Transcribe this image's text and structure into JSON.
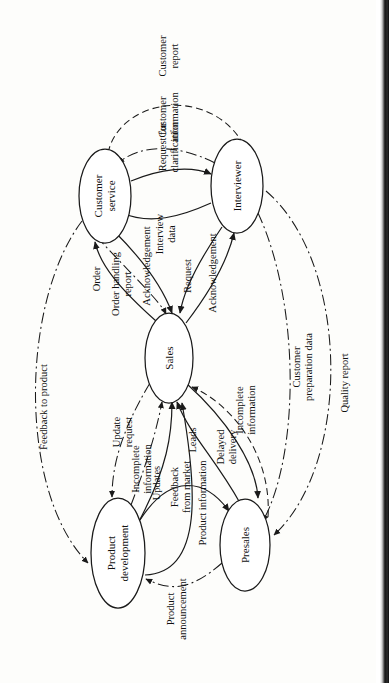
{
  "diagram": {
    "type": "data-flow-diagram",
    "orientation": "rotated-90-ccw",
    "title": "",
    "nodes": [
      {
        "id": "product_development",
        "label": "Product\ndevelopment",
        "line1": "Product",
        "line2": "development",
        "cx": 130,
        "cy": 118,
        "rx": 55,
        "ry": 27
      },
      {
        "id": "presales",
        "label": "Presales",
        "line1": "Presales",
        "line2": "",
        "cx": 138,
        "cy": 245,
        "rx": 46,
        "ry": 25
      },
      {
        "id": "sales",
        "label": "Sales",
        "line1": "Sales",
        "line2": "",
        "cx": 325,
        "cy": 169,
        "rx": 45,
        "ry": 24
      },
      {
        "id": "customer_service",
        "label": "Customer\nservice",
        "line1": "Customer",
        "line2": "service",
        "cx": 487,
        "cy": 105,
        "rx": 47,
        "ry": 26
      },
      {
        "id": "interviewer",
        "label": "Interviewer",
        "line1": "Interviewer",
        "line2": "",
        "cx": 497,
        "cy": 237,
        "rx": 47,
        "ry": 26
      }
    ],
    "edges": [
      {
        "id": "e1",
        "label": "Feedback\nfrom market",
        "from": "product_development",
        "to": "presales",
        "style": "solid"
      },
      {
        "id": "e2",
        "label": "Product\nannouncement",
        "from": "presales",
        "to": "product_development",
        "style": "dashdot"
      },
      {
        "id": "e3",
        "label": "Update\nrequest",
        "from": "sales",
        "to": "product_development",
        "style": "dashdot"
      },
      {
        "id": "e4",
        "label": "Incomplete\ninformation",
        "from": "product_development",
        "to": "sales",
        "style": "dashdot"
      },
      {
        "id": "e5",
        "label": "Updates",
        "from": "product_development",
        "to": "sales",
        "style": "solid"
      },
      {
        "id": "e6",
        "label": "Leads",
        "from": "presales",
        "to": "sales",
        "style": "solid"
      },
      {
        "id": "e7",
        "label": "Delayed\ndelivery",
        "from": "sales",
        "to": "presales",
        "style": "solid"
      },
      {
        "id": "e8",
        "label": "Incomplete\ninformation",
        "from": "presales",
        "to": "sales",
        "style": "dashed"
      },
      {
        "id": "e9",
        "label": "Product information",
        "from": "product_development",
        "to": "sales",
        "style": "solid"
      },
      {
        "id": "e10",
        "label": "Order handling\nreport",
        "from": "customer_service",
        "to": "sales",
        "style": "dashdot"
      },
      {
        "id": "e11",
        "label": "Acknowledgement",
        "from": "customer_service",
        "to": "sales",
        "style": "solid"
      },
      {
        "id": "e12",
        "label": "Order",
        "from": "sales",
        "to": "customer_service",
        "style": "solid"
      },
      {
        "id": "e13",
        "label": "Request",
        "from": "sales",
        "to": "interviewer",
        "style": "solid"
      },
      {
        "id": "e14",
        "label": "Acknowledgement",
        "from": "interviewer",
        "to": "sales",
        "style": "solid"
      },
      {
        "id": "e15",
        "label": "Interview\ndata",
        "from": "interviewer",
        "to": "customer_service",
        "style": "solid"
      },
      {
        "id": "e16",
        "label": "Request for\nclarification",
        "from": "customer_service",
        "to": "interviewer",
        "style": "solid"
      },
      {
        "id": "e17",
        "label": "Customer\ninformation",
        "from": "interviewer",
        "to": "customer_service",
        "style": "dashdot"
      },
      {
        "id": "e18",
        "label": "Customer\nreport",
        "from": "customer_service",
        "to": "interviewer",
        "style": "dashed"
      },
      {
        "id": "e19",
        "label": "Feedback to product",
        "from": "customer_service",
        "to": "product_development",
        "style": "dashdot"
      },
      {
        "id": "e20",
        "label": "Customer\npreparation data",
        "from": "interviewer",
        "to": "presales",
        "style": "dashdot"
      },
      {
        "id": "e21",
        "label": "Quality report",
        "from": "interviewer",
        "to": "presales",
        "style": "dashdot"
      }
    ],
    "edge_labels": {
      "feedback_from_market_l1": "Feedback",
      "feedback_from_market_l2": "from market",
      "product_announcement_l1": "Product",
      "product_announcement_l2": "announcement",
      "update_request_l1": "Update",
      "update_request_l2": "request",
      "incomplete_information_pd_l1": "Incomplete",
      "incomplete_information_pd_l2": "information",
      "updates": "Updates",
      "leads": "Leads",
      "delayed_delivery_l1": "Delayed",
      "delayed_delivery_l2": "delivery",
      "incomplete_information_ps_l1": "Incomplete",
      "incomplete_information_ps_l2": "information",
      "product_information": "Product information",
      "order_handling_report_l1": "Order handling",
      "order_handling_report_l2": "report",
      "acknowledgement_cs": "Acknowledgement",
      "order": "Order",
      "request": "Request",
      "acknowledgement_iv": "Acknowledgement",
      "interview_data_l1": "Interview",
      "interview_data_l2": "data",
      "request_for_clarification_l1": "Request for",
      "request_for_clarification_l2": "clarification",
      "customer_information_l1": "Customer",
      "customer_information_l2": "information",
      "customer_report_l1": "Customer",
      "customer_report_l2": "report",
      "feedback_to_product": "Feedback to product",
      "customer_preparation_data_l1": "Customer",
      "customer_preparation_data_l2": "preparation data",
      "quality_report": "Quality report"
    },
    "node_labels": {
      "product_development_l1": "Product",
      "product_development_l2": "development",
      "presales": "Presales",
      "sales": "Sales",
      "customer_service_l1": "Customer",
      "customer_service_l2": "service",
      "interviewer": "Interviewer"
    },
    "colors": {
      "stroke": "#1a1a1a",
      "node_fill": "#ffffff",
      "background": "#fdfdfb",
      "scan_edge": "#151515"
    }
  }
}
